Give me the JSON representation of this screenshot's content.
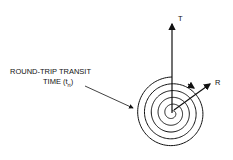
{
  "diagram": {
    "labels": {
      "transit_line1": "ROUND-TRIP TRANSIT",
      "transit_line2": "TIME (t",
      "transit_sub": "rt",
      "transit_close": ")",
      "t_axis": "T",
      "r_axis": "R"
    },
    "colors": {
      "stroke": "#111111",
      "background": "#ffffff"
    }
  }
}
